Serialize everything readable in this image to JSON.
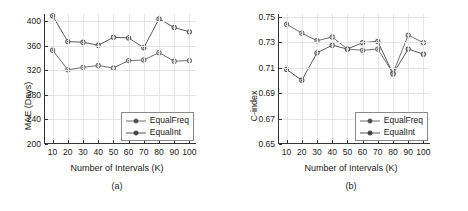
{
  "figure": {
    "panels": [
      {
        "caption": "(a)",
        "xlabel": "Number of Intervals (K)",
        "ylabel": "MAE (Days)",
        "legend": [
          "EqualFreq",
          "EqualInt"
        ]
      },
      {
        "caption": "(b)",
        "xlabel": "Number of Intervals (K)",
        "ylabel": "C-index",
        "legend": [
          "EqualFreq",
          "EqualInt"
        ]
      }
    ]
  },
  "chart_data": [
    {
      "type": "line",
      "title": "(a)",
      "xlabel": "Number of Intervals (K)",
      "ylabel": "MAE (Days)",
      "x": [
        10,
        20,
        30,
        40,
        50,
        60,
        70,
        80,
        90,
        100
      ],
      "xticklabels": [
        "10",
        "20",
        "30",
        "40",
        "50",
        "60",
        "70",
        "80",
        "90",
        "100"
      ],
      "yticklabels": [
        "200",
        "240",
        "280",
        "320",
        "360",
        "400"
      ],
      "yticks": [
        200,
        240,
        280,
        320,
        360,
        400
      ],
      "xlim": [
        5,
        105
      ],
      "ylim": [
        200,
        412
      ],
      "grid": true,
      "legend_position": "lower right",
      "series": [
        {
          "name": "EqualFreq",
          "color": "#6e6e6e",
          "marker": "circle",
          "values": [
            353,
            321,
            325,
            328,
            324,
            336,
            337,
            349,
            335,
            336
          ]
        },
        {
          "name": "EqualInt",
          "color": "#5a5a5a",
          "marker": "circle",
          "values": [
            409,
            367,
            366,
            361,
            374,
            373,
            357,
            404,
            390,
            383
          ]
        }
      ]
    },
    {
      "type": "line",
      "title": "(b)",
      "xlabel": "Number of Intervals (K)",
      "ylabel": "C-index",
      "x": [
        10,
        20,
        30,
        40,
        50,
        60,
        70,
        80,
        90,
        100
      ],
      "xticklabels": [
        "10",
        "20",
        "30",
        "40",
        "50",
        "60",
        "70",
        "80",
        "90",
        "100"
      ],
      "yticklabels": [
        "0.65",
        "0.67",
        "0.69",
        "0.71",
        "0.73",
        "0.75"
      ],
      "yticks": [
        0.65,
        0.67,
        0.69,
        0.71,
        0.73,
        0.75
      ],
      "xlim": [
        5,
        105
      ],
      "ylim": [
        0.65,
        0.752
      ],
      "grid": true,
      "legend_position": "lower right",
      "series": [
        {
          "name": "EqualFreq",
          "color": "#6e6e6e",
          "marker": "circle",
          "values": [
            0.744,
            0.737,
            0.731,
            0.734,
            0.7245,
            0.7235,
            0.7245,
            0.7055,
            0.7355,
            0.7295
          ]
        },
        {
          "name": "EqualInt",
          "color": "#5a5a5a",
          "marker": "circle",
          "values": [
            0.7085,
            0.7,
            0.7215,
            0.7275,
            0.7245,
            0.7295,
            0.7305,
            0.705,
            0.7245,
            0.7205
          ]
        }
      ]
    }
  ]
}
